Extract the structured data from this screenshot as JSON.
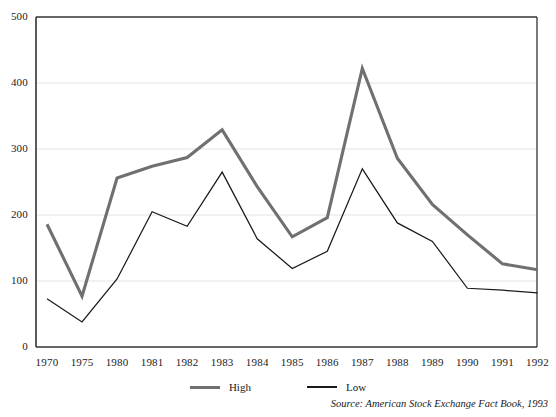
{
  "chart_data": {
    "type": "line",
    "title": "",
    "xlabel": "",
    "ylabel": "",
    "categories": [
      "1970",
      "1975",
      "1980",
      "1981",
      "1982",
      "1983",
      "1984",
      "1985",
      "1986",
      "1987",
      "1988",
      "1989",
      "1990",
      "1991",
      "1992"
    ],
    "series": [
      {
        "name": "High",
        "color": "#707070",
        "values": [
          186,
          77,
          256,
          274,
          287,
          329,
          243,
          167,
          196,
          422,
          286,
          216,
          170,
          126,
          117
        ]
      },
      {
        "name": "Low",
        "color": "#1a1a1a",
        "values": [
          73,
          38,
          103,
          205,
          183,
          265,
          164,
          119,
          145,
          270,
          188,
          160,
          89,
          86,
          82
        ]
      }
    ],
    "ylim": [
      0,
      500
    ],
    "y_ticks": [
      0,
      100,
      200,
      300,
      400,
      500
    ],
    "grid": true,
    "legend_position": "bottom",
    "annotations": [
      "Source: American Stock Exchange Fact Book, 1993"
    ]
  },
  "axes": {
    "y_tick_labels": [
      "500",
      "400",
      "300",
      "200",
      "100",
      "0"
    ],
    "x_tick_labels": [
      "1970",
      "1975",
      "1980",
      "1981",
      "1982",
      "1983",
      "1984",
      "1985",
      "1986",
      "1987",
      "1988",
      "1989",
      "1990",
      "1991",
      "1992"
    ]
  },
  "legend": {
    "items": [
      {
        "label": "High"
      },
      {
        "label": "Low"
      }
    ]
  },
  "source": {
    "text": "Source: American Stock Exchange Fact Book, 1993"
  },
  "colors": {
    "high_line": "#707070",
    "low_line": "#1a1a1a",
    "axis": "#333333",
    "grid": "#e2e2e2",
    "background": "#ffffff"
  }
}
